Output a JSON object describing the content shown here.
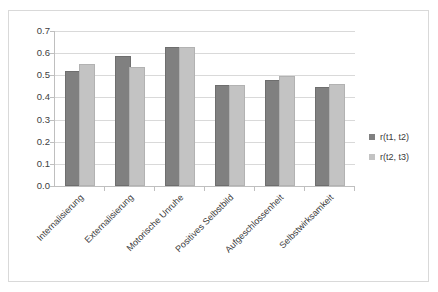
{
  "chart_data": {
    "type": "bar",
    "title": "",
    "subtitle": "",
    "xlabel": "",
    "ylabel": "",
    "ylim": [
      0.0,
      0.7
    ],
    "ytick_labels": [
      "0.7",
      "0.6",
      "0.5",
      "0.4",
      "0.3",
      "0.2",
      "0.1",
      "0.0"
    ],
    "ytick_values": [
      0.7,
      0.6,
      0.5,
      0.4,
      0.3,
      0.2,
      0.1,
      0.0
    ],
    "grid": true,
    "legend_position": "right",
    "categories": [
      "Internalisierung",
      "Externalisierung",
      "Motorische Unruhe",
      "Positives Selbstbild",
      "Aufgeschlossenheit",
      "Selbstwirksamkeit"
    ],
    "series": [
      {
        "name": "r(t1, t2)",
        "color": "#808080",
        "values": [
          0.51,
          0.58,
          0.62,
          0.445,
          0.47,
          0.44
        ]
      },
      {
        "name": "r(t2, t3)",
        "color": "#c3c3c3",
        "values": [
          0.54,
          0.53,
          0.62,
          0.445,
          0.49,
          0.45
        ]
      }
    ]
  },
  "legend": {
    "entries": [
      {
        "label": "r(t1, t2)"
      },
      {
        "label": "r(t2, t3)"
      }
    ]
  },
  "colors": {
    "series_1": "#808080",
    "series_2": "#c3c3c3",
    "gridline": "#d9d9d9",
    "axis": "#bfbfbf",
    "frame_border": "#d9d9d9",
    "text": "#3a3a3a",
    "background": "#ffffff"
  }
}
